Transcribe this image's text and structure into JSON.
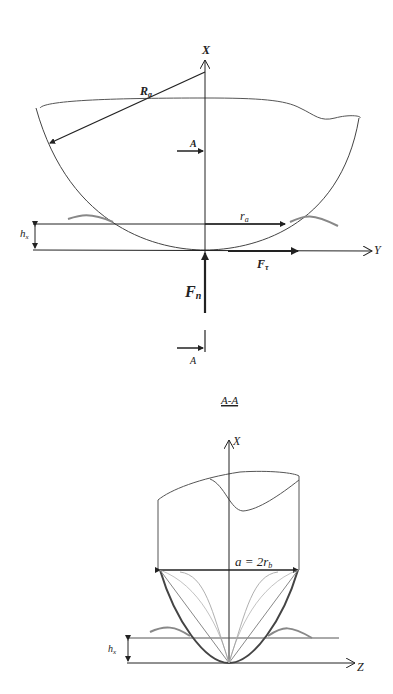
{
  "figure": {
    "top_view": {
      "axis_x_label": "X",
      "axis_y_label": "Y",
      "radius_label": "R",
      "radius_sub": "a",
      "section_marker_top": "A",
      "section_marker_bottom": "A",
      "depth_label": "h",
      "depth_sub": "x",
      "contact_radius_label": "r",
      "contact_radius_sub": "a",
      "tangential_force_label": "F",
      "tangential_force_sub": "τ",
      "normal_force_label": "F",
      "normal_force_sub": "n"
    },
    "section_view": {
      "title": "A-A",
      "axis_x_label": "X",
      "axis_z_label": "Z",
      "width_label": "a = 2r",
      "width_sub": "b",
      "depth_label": "h",
      "depth_sub": "x"
    }
  },
  "colors": {
    "line": "#222222",
    "surface": "#888888",
    "light_curve": "#b0b0b0"
  }
}
